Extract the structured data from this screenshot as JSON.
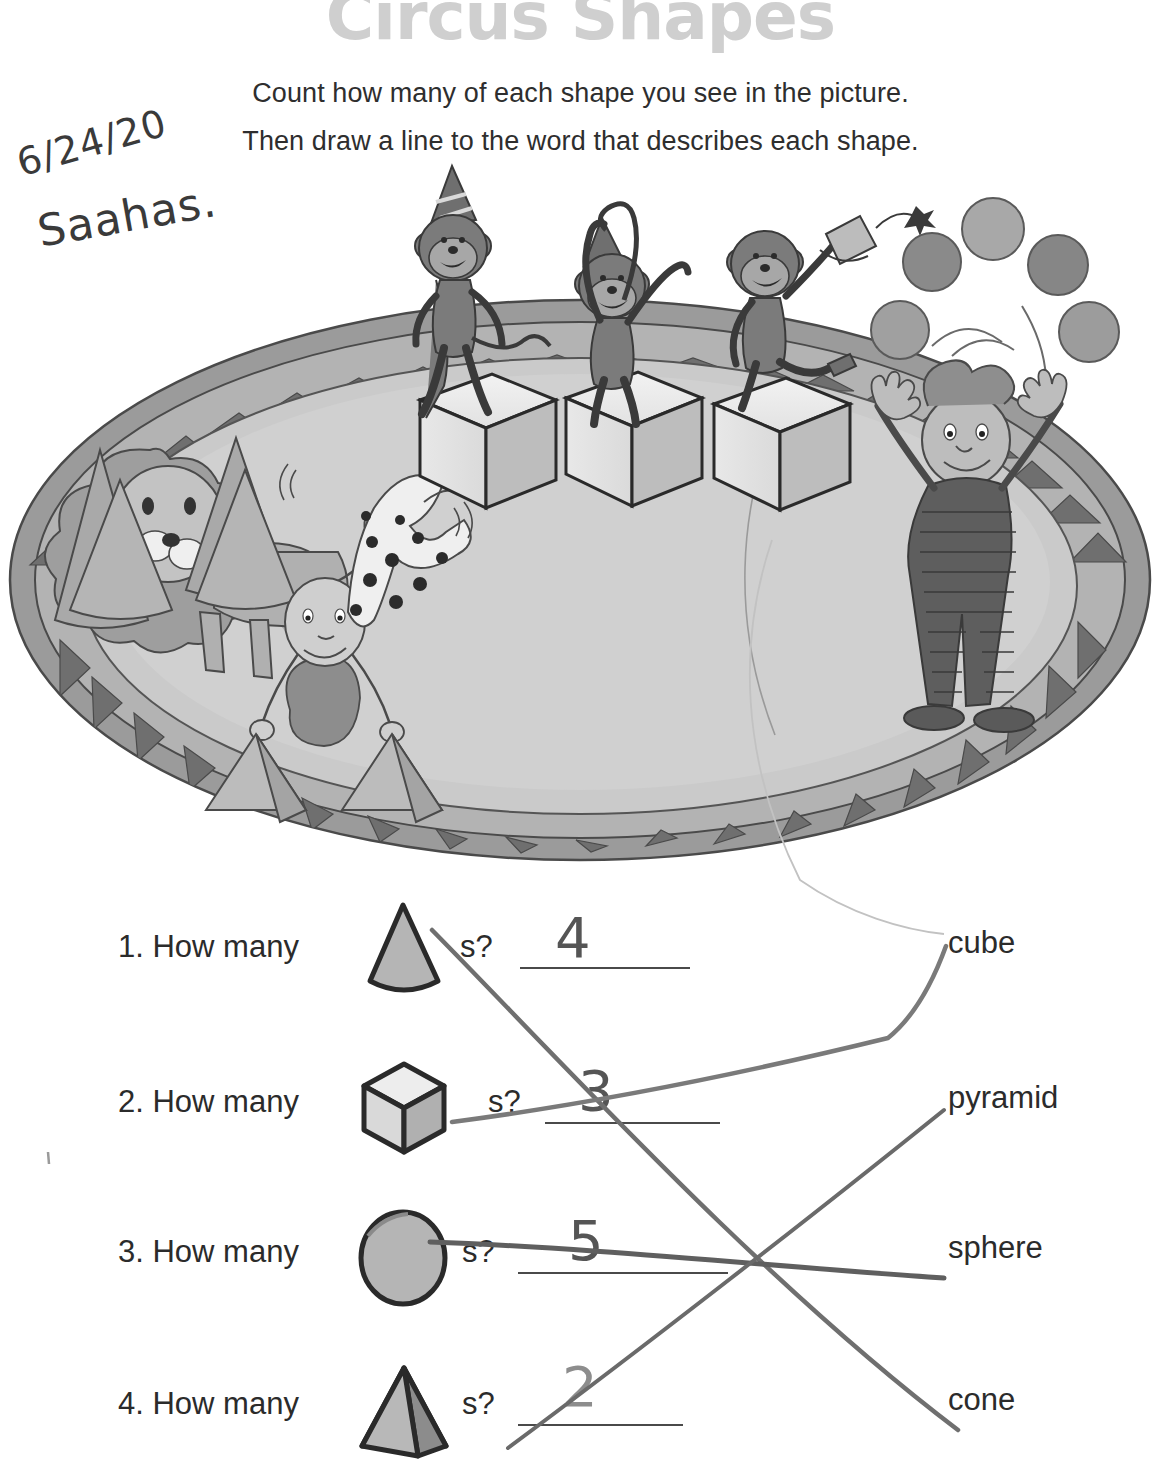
{
  "title": "Circus Shapes",
  "instructions": {
    "line1": "Count how many of each shape you see in the picture.",
    "line2": "Then draw a line to the word that describes each shape."
  },
  "handwriting": {
    "date": "6/24/20",
    "name": "Saahas."
  },
  "questions": [
    {
      "number": "1. How many",
      "shape": "cone",
      "suffix": "s?",
      "answer": "4"
    },
    {
      "number": "2. How many",
      "shape": "cube",
      "suffix": "s?",
      "answer": "3"
    },
    {
      "number": "3. How many",
      "shape": "sphere",
      "suffix": "s?",
      "answer": "5"
    },
    {
      "number": "4. How many",
      "shape": "pyramid",
      "suffix": "s?",
      "answer": "2"
    }
  ],
  "word_bank": [
    {
      "label": "cube"
    },
    {
      "label": "pyramid"
    },
    {
      "label": "sphere"
    },
    {
      "label": "cone"
    }
  ],
  "illustration": {
    "scene": "circus-ring",
    "ring_border_pattern": "zigzag-triangles",
    "characters": [
      "lion",
      "three-monkeys",
      "handstand-boy",
      "juggler"
    ],
    "counts": {
      "cones": 4,
      "cubes": 3,
      "spheres": 5,
      "pyramids": 2
    }
  },
  "colors": {
    "title_gray": "#cfcfcf",
    "text_dark": "#2b2b2b",
    "pencil": "#6e6e6e",
    "ring_fill": "#c9c9c9",
    "ring_band": "#a6a6a6",
    "ring_dark": "#7a7a7a",
    "shape_fill": "#b8b8b8",
    "shape_outline": "#2a2a2a"
  }
}
